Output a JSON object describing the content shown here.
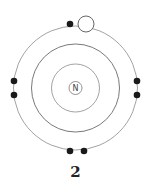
{
  "diagram": {
    "type": "bohr-model",
    "nucleus_label": "N",
    "caption": "2",
    "center": [
      75.5,
      88
    ],
    "nucleus_radius": 6.5,
    "ring_radii": [
      24,
      44,
      62
    ],
    "electrons_filled": [
      [
        70,
        24
      ],
      [
        14,
        81
      ],
      [
        14,
        95
      ],
      [
        137,
        81
      ],
      [
        137,
        95
      ],
      [
        70,
        151
      ],
      [
        84,
        151
      ]
    ],
    "electron_empty": [
      86,
      24
    ],
    "colors": {
      "ring": "#8a8a8a",
      "electron": "#1a1a1a",
      "background": "#ffffff"
    }
  }
}
